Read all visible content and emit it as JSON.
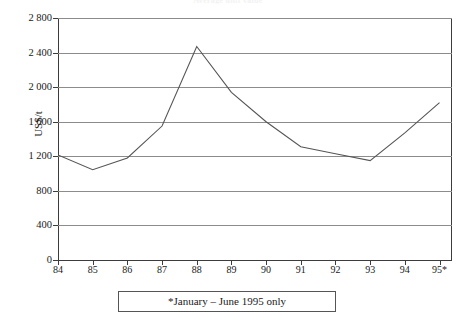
{
  "chart_data": {
    "type": "line",
    "title": "Average unit value",
    "xlabel": "",
    "ylabel": "US$/t",
    "categories": [
      "84",
      "85",
      "86",
      "87",
      "88",
      "89",
      "90",
      "91",
      "92",
      "93",
      "94",
      "95*"
    ],
    "values": [
      1215,
      1045,
      1180,
      1550,
      2470,
      1940,
      1600,
      1310,
      1230,
      1150,
      1470,
      1820
    ],
    "series": [
      {
        "name": "US$/t",
        "values": [
          1215,
          1045,
          1180,
          1550,
          2470,
          1940,
          1600,
          1310,
          1230,
          1150,
          1470,
          1820
        ]
      }
    ],
    "ylim": [
      0,
      2800
    ],
    "ytick_values": [
      0,
      400,
      800,
      1200,
      1600,
      2000,
      2400,
      2800
    ],
    "ytick_labels": [
      "0",
      "400",
      "800",
      "1 200",
      "1 600",
      "2 000",
      "2 400",
      "2 800"
    ],
    "grid": true,
    "legend": false,
    "legend_position": "none",
    "line_color": "#555555",
    "grid_color": "#8c8c8c",
    "axis_color": "#3c3c3c",
    "footnote": "*January – June 1995 only"
  }
}
